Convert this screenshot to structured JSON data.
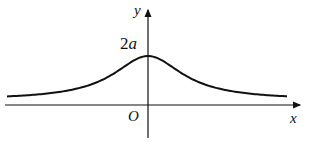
{
  "diagram": {
    "labels": {
      "y_axis": "y",
      "x_axis": "x",
      "origin": "O",
      "peak_value": "2a"
    },
    "colors": {
      "stroke": "#111111",
      "background": "#ffffff"
    }
  }
}
